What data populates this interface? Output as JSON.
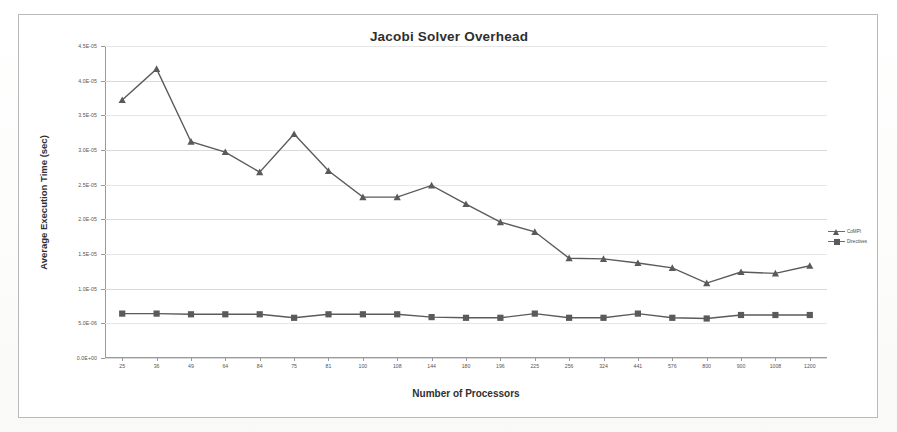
{
  "chart_data": {
    "type": "line",
    "title": "Jacobi Solver Overhead",
    "xlabel": "Number of Processors",
    "ylabel": "Average Execution Time (sec)",
    "categories": [
      "25",
      "36",
      "49",
      "64",
      "84",
      "75",
      "81",
      "100",
      "108",
      "144",
      "180",
      "196",
      "225",
      "256",
      "324",
      "441",
      "576",
      "800",
      "900",
      "1008",
      "1200"
    ],
    "ytick_labels": [
      "0.0E+00",
      "5.0E-06",
      "1.0E-05",
      "1.5E-05",
      "2.0E-05",
      "2.5E-05",
      "3.0E-05",
      "3.5E-05",
      "4.0E-05",
      "4.5E-05"
    ],
    "ytick_values": [
      0,
      5e-06,
      1e-05,
      1.5e-05,
      2e-05,
      2.5e-05,
      3e-05,
      3.5e-05,
      4e-05,
      4.5e-05
    ],
    "ylim": [
      0,
      4.5e-05
    ],
    "grid": true,
    "legend_position": "right",
    "series": [
      {
        "name": "CoMPI",
        "marker": "triangle",
        "color": "#5a5a5a",
        "values": [
          3.72e-05,
          4.17e-05,
          3.12e-05,
          2.97e-05,
          2.68e-05,
          3.23e-05,
          2.7e-05,
          2.32e-05,
          2.32e-05,
          2.49e-05,
          2.22e-05,
          1.96e-05,
          1.82e-05,
          1.44e-05,
          1.43e-05,
          1.37e-05,
          1.3e-05,
          1.08e-05,
          1.24e-05,
          1.22e-05,
          1.33e-05
        ]
      },
      {
        "name": "Directives",
        "marker": "square",
        "color": "#5a5a5a",
        "values": [
          6.4e-06,
          6.4e-06,
          6.3e-06,
          6.3e-06,
          6.3e-06,
          5.8e-06,
          6.3e-06,
          6.3e-06,
          6.3e-06,
          5.9e-06,
          5.8e-06,
          5.8e-06,
          6.4e-06,
          5.8e-06,
          5.8e-06,
          6.4e-06,
          5.8e-06,
          5.7e-06,
          6.2e-06,
          6.2e-06,
          6.2e-06
        ]
      }
    ]
  }
}
